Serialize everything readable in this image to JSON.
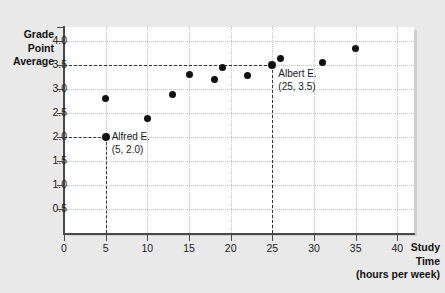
{
  "chart_data": {
    "type": "scatter",
    "title": "",
    "xlabel": "Study Time (hours per week)",
    "ylabel": "Grade Point Average",
    "xlim": [
      0,
      42
    ],
    "ylim": [
      0,
      4.3
    ],
    "grid": true,
    "legend": "none",
    "x": [
      5,
      5,
      10,
      13,
      15,
      18,
      19,
      22,
      25,
      26,
      31,
      35
    ],
    "y": [
      2.0,
      2.8,
      2.4,
      2.9,
      3.3,
      3.2,
      3.45,
      3.28,
      3.5,
      3.65,
      3.55,
      3.85
    ],
    "points": [
      {
        "x": 5,
        "y": 2.0,
        "label": "Alfred E."
      },
      {
        "x": 5,
        "y": 2.8,
        "label": ""
      },
      {
        "x": 10,
        "y": 2.4,
        "label": ""
      },
      {
        "x": 13,
        "y": 2.9,
        "label": ""
      },
      {
        "x": 15,
        "y": 3.3,
        "label": ""
      },
      {
        "x": 18,
        "y": 3.2,
        "label": ""
      },
      {
        "x": 19,
        "y": 3.45,
        "label": ""
      },
      {
        "x": 22,
        "y": 3.28,
        "label": ""
      },
      {
        "x": 25,
        "y": 3.5,
        "label": "Albert E."
      },
      {
        "x": 26,
        "y": 3.65,
        "label": ""
      },
      {
        "x": 31,
        "y": 3.55,
        "label": ""
      },
      {
        "x": 35,
        "y": 3.85,
        "label": ""
      }
    ],
    "xticks": [
      "0",
      "5",
      "10",
      "15",
      "20",
      "25",
      "30",
      "35",
      "40"
    ],
    "xtick_values": [
      0,
      5,
      10,
      15,
      20,
      25,
      30,
      35,
      40
    ],
    "yticks": [
      "0.5",
      "1.0",
      "1.5",
      "2.0",
      "2.5",
      "3.0",
      "3.5",
      "4.0"
    ],
    "ytick_values": [
      0.5,
      1.0,
      1.5,
      2.0,
      2.5,
      3.0,
      3.5,
      4.0
    ],
    "annotations": [
      {
        "name": "alfred",
        "line1": "Alfred E.",
        "line2": "(5, 2.0)",
        "x": 5,
        "y": 2.0
      },
      {
        "name": "albert",
        "line1": "Albert E.",
        "line2": "(25, 3.5)",
        "x": 25,
        "y": 3.5
      }
    ],
    "reference_lines": [
      {
        "orientation": "horizontal",
        "value": 3.5,
        "from": 0,
        "to": 25
      },
      {
        "orientation": "horizontal",
        "value": 2.0,
        "from": 0,
        "to": 5
      },
      {
        "orientation": "vertical",
        "value": 5,
        "from": 0,
        "to": 2.0
      },
      {
        "orientation": "vertical",
        "value": 25,
        "from": 0,
        "to": 3.5
      }
    ]
  },
  "axis_titles": {
    "y_line1": "Grade",
    "y_line2": "Point",
    "y_line3": "Average",
    "x_line1": "Study",
    "x_line2": "Time",
    "x_line3": "(hours per week)"
  },
  "colors": {
    "page_background": "#e9e9e9",
    "plot_background": "#ffffff",
    "axis": "#4a4a4a",
    "grid": "#c6c6c6",
    "marker": "#111111",
    "reference_line": "#333333",
    "text": "#1a1a1a"
  }
}
